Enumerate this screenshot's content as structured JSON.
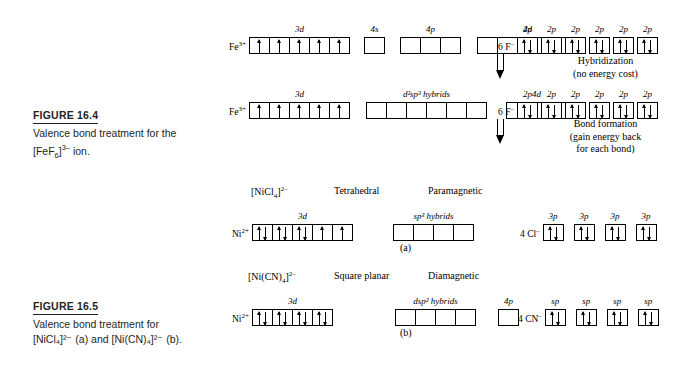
{
  "figures": [
    {
      "id": "figure-16-4",
      "label": "FIGURE 16.4",
      "line1": "Valence bond treatment for the",
      "line2_pre": "[FeF",
      "line2_sub": "6",
      "line2_sup": "3–",
      "line2_post": " ion.",
      "bracket_close": "]"
    },
    {
      "id": "figure-16-5",
      "label": "FIGURE 16.5",
      "line1": "Valence bond treatment for",
      "line2": "[NiCl₄]²⁻ (a) and [Ni(CN)₄]²⁻ (b)."
    }
  ],
  "fef6": {
    "row1": {
      "ion": "Fe",
      "ion_charge": "3+",
      "groups": [
        {
          "label": "3d",
          "boxes": 5,
          "fill": [
            "up",
            "up",
            "up",
            "up",
            "up"
          ]
        },
        {
          "label": "4s",
          "boxes": 1,
          "fill": [
            "",
            ""
          ]
        },
        {
          "label": "4p",
          "boxes": 3,
          "fill": [
            "",
            "",
            ""
          ]
        },
        {
          "label": "4d",
          "boxes": 5,
          "fill": [
            "",
            "",
            "",
            "",
            ""
          ]
        }
      ],
      "ligand": {
        "count": "6 F",
        "charge": "–",
        "orbital_label": "2p",
        "units": 6,
        "fill": "paired"
      }
    },
    "process1": {
      "line1": "Hybridization",
      "line2": "(no energy cost)"
    },
    "row2": {
      "ion": "Fe",
      "ion_charge": "3+",
      "groups": [
        {
          "label": "3d",
          "boxes": 5,
          "fill": [
            "up",
            "up",
            "up",
            "up",
            "up"
          ]
        },
        {
          "label": "d2sp3 hybrids",
          "boxes": 6,
          "fill": [
            "",
            "",
            "",
            "",
            "",
            ""
          ]
        },
        {
          "label": "4d",
          "boxes": 3,
          "fill": [
            "",
            "",
            ""
          ]
        }
      ],
      "ligand": {
        "count": "6 F",
        "charge": "–",
        "orbital_label": "2p",
        "units": 6,
        "fill": "paired"
      }
    },
    "process2": {
      "line1": "Bond formation",
      "line2": "(gain energy back",
      "line3": "for each bond)"
    }
  },
  "nicl4": {
    "complex": "[NiCl₄]²⁻",
    "geometry": "Tetrahedral",
    "magnetism": "Paramagnetic",
    "panel": "(a)",
    "ion": "Ni",
    "ion_charge": "2+",
    "groups": [
      {
        "label": "3d",
        "boxes": 5,
        "fill": [
          "paired",
          "paired",
          "paired",
          "up",
          "up"
        ]
      },
      {
        "label": "sp3 hybrids",
        "boxes": 4,
        "fill": [
          "",
          "",
          "",
          ""
        ]
      }
    ],
    "ligand": {
      "count": "4 Cl",
      "charge": "–",
      "orbital_label": "3p",
      "units": 4,
      "fill": "paired"
    }
  },
  "nicn4": {
    "complex": "[Ni(CN)₄]²⁻",
    "geometry": "Square planar",
    "magnetism": "Diamagnetic",
    "panel": "(b)",
    "ion": "Ni",
    "ion_charge": "2+",
    "groups": [
      {
        "label": "3d",
        "boxes": 4,
        "fill": [
          "paired",
          "paired",
          "paired",
          "paired"
        ]
      },
      {
        "label": "dsp2 hybrids",
        "boxes": 4,
        "fill": [
          "",
          "",
          "",
          ""
        ]
      },
      {
        "label": "4p",
        "boxes": 1,
        "fill": [
          ""
        ]
      }
    ],
    "ligand": {
      "count": "4 CN",
      "charge": "–",
      "orbital_label": "sp",
      "units": 4,
      "fill": "paired"
    }
  },
  "labels": {
    "d2sp3": "d²sp³ hybrids",
    "sp3": "sp³ hybrids",
    "dsp2": "dsp² hybrids",
    "orb_3d": "3d",
    "orb_4s": "4s",
    "orb_4p": "4p",
    "orb_4d": "4d",
    "orb_2p": "2p",
    "orb_3p": "3p",
    "orb_sp": "sp"
  }
}
